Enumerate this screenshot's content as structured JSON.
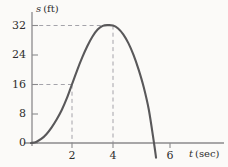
{
  "figure": {
    "background_color": "#fbfaf8",
    "curve_color": "#59585a",
    "axis_color": "#8b8a8c",
    "dash_color": "#9a99a0",
    "text_color": "#2e2e2e"
  },
  "axes": {
    "y_axis_label": "s (ft)",
    "y_axis_label_symbol": "s",
    "y_axis_label_unit": "(ft)",
    "x_axis_label": "t (sec)",
    "x_axis_label_symbol": "t",
    "x_axis_label_unit": "(sec)",
    "y_ticks": [
      "0",
      "8",
      "16",
      "24",
      "32"
    ],
    "x_ticks": [
      "2",
      "4",
      "6"
    ],
    "origin_label": "0"
  },
  "chart_data": {
    "type": "line",
    "title": "",
    "xlabel": "t (sec)",
    "ylabel": "s (ft)",
    "xlim": [
      0,
      7
    ],
    "ylim": [
      0,
      36
    ],
    "grid": false,
    "legend": null,
    "x_ticks": [
      2,
      4,
      6
    ],
    "y_ticks": [
      0,
      8,
      16,
      24,
      32
    ],
    "series": [
      {
        "name": "s(t)",
        "color": "#59585a",
        "x": [
          0,
          0.25,
          0.5,
          0.75,
          1.0,
          1.25,
          1.5,
          1.75,
          2.0,
          2.25,
          2.5,
          2.75,
          3.0,
          3.25,
          3.5,
          3.75,
          4.0,
          4.25,
          4.5,
          4.75,
          5.0,
          5.25,
          5.5,
          5.75,
          6.0,
          6.1
        ],
        "y": [
          0.0,
          0.3,
          1.1,
          2.4,
          4.2,
          6.4,
          9.0,
          12.2,
          16.0,
          19.8,
          23.3,
          26.4,
          29.0,
          30.9,
          31.9,
          32.1,
          32.0,
          31.2,
          29.6,
          27.2,
          24.0,
          20.0,
          15.2,
          9.0,
          0.0,
          -4.0
        ]
      }
    ],
    "annotations": [
      {
        "name": "guide-16",
        "type": "dashed-horizontal",
        "y": 16,
        "x_from": 0,
        "x_to": 2
      },
      {
        "name": "guide-32",
        "type": "dashed-horizontal",
        "y": 32,
        "x_from": 0,
        "x_to": 4
      },
      {
        "name": "guide-t2",
        "type": "dashed-vertical",
        "x": 2,
        "y_from": 0,
        "y_to": 16
      },
      {
        "name": "guide-t4",
        "type": "dashed-vertical",
        "x": 4,
        "y_from": 0,
        "y_to": 32
      }
    ],
    "key_points": [
      {
        "t": 0,
        "s": 0
      },
      {
        "t": 2,
        "s": 16
      },
      {
        "t": 4,
        "s": 32
      },
      {
        "t": 6,
        "s": 0
      }
    ]
  }
}
